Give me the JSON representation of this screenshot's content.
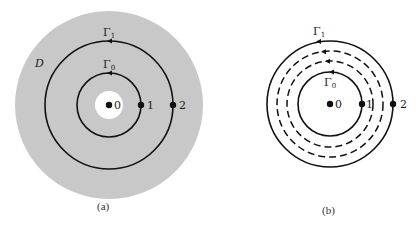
{
  "colors": {
    "region": "#c8c8c8",
    "stroke": "#111111",
    "background": "#ffffff"
  },
  "panel_a": {
    "caption": "(a)",
    "region_label": "D",
    "outer_contour_label": "Γ",
    "outer_contour_sub": "1",
    "inner_contour_label": "Γ",
    "inner_contour_sub": "0",
    "points": [
      {
        "label": "0"
      },
      {
        "label": "1"
      },
      {
        "label": "2"
      }
    ]
  },
  "panel_b": {
    "caption": "(b)",
    "outer_contour_label": "Γ",
    "outer_contour_sub": "1",
    "inner_contour_label": "Γ",
    "inner_contour_sub": "0",
    "points": [
      {
        "label": "0"
      },
      {
        "label": "1"
      },
      {
        "label": "2"
      }
    ]
  }
}
